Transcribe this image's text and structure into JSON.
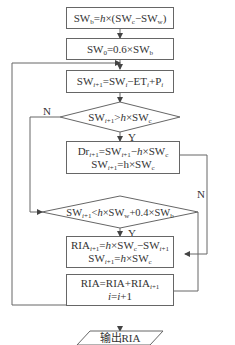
{
  "flowchart": {
    "nodes": [
      {
        "id": "n1",
        "shape": "rect",
        "text": "SWb=h×(SWc−SWw)"
      },
      {
        "id": "n2",
        "shape": "rect",
        "text": "SW0=0.6×SWb"
      },
      {
        "id": "n3",
        "shape": "rect",
        "text": "SWi+1=SWi−ETi+Pi"
      },
      {
        "id": "n4",
        "shape": "diamond",
        "text": "SWi+1>h×SWc"
      },
      {
        "id": "n5",
        "shape": "rect",
        "lines": [
          "Dri+1=SWi+1−h×SWc",
          "SWi+1=h×SWc"
        ]
      },
      {
        "id": "n6",
        "shape": "diamond",
        "text": "SWi+1<h×SWw+0.4×SWb"
      },
      {
        "id": "n7",
        "shape": "rect",
        "lines": [
          "RIAi+1=h×SWc−SWi+1",
          "SWi+1=h×SWc"
        ]
      },
      {
        "id": "n8",
        "shape": "rect",
        "lines": [
          "RIA=RIA+RIAi+1",
          "i=i+1"
        ]
      },
      {
        "id": "n9",
        "shape": "parallelogram",
        "text": "输出RIA"
      }
    ],
    "labels": {
      "d1_no": "N",
      "d1_yes": "Y",
      "d2_no": "N",
      "d2_yes": "Y"
    },
    "edges": [
      [
        "n1",
        "n2"
      ],
      [
        "n2",
        "n3"
      ],
      [
        "n3",
        "n4"
      ],
      [
        "n4",
        "n5",
        "Y"
      ],
      [
        "n4",
        "n6",
        "N"
      ],
      [
        "n5",
        "n8",
        "bypass"
      ],
      [
        "n6",
        "n7",
        "Y"
      ],
      [
        "n6",
        "n8",
        "N"
      ],
      [
        "n7",
        "n8"
      ],
      [
        "n8",
        "n3",
        "loop"
      ],
      [
        "n8",
        "n9"
      ]
    ],
    "colors": {
      "line": "#666666",
      "text": "#333333"
    }
  }
}
